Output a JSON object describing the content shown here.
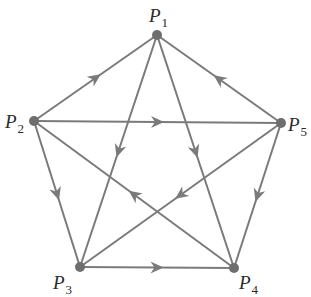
{
  "diagram": {
    "type": "directed-graph",
    "colors": {
      "edge": "#7a7a7a",
      "node": "#6e6e6e",
      "label": "#2a2a2a",
      "background": "#ffffff"
    },
    "nodes": [
      {
        "id": "P1",
        "letter": "P",
        "sub": "1",
        "x": 157,
        "y": 35,
        "label_x": 149,
        "label_y": 22
      },
      {
        "id": "P2",
        "letter": "P",
        "sub": "2",
        "x": 34,
        "y": 121,
        "label_x": 5,
        "label_y": 128
      },
      {
        "id": "P3",
        "letter": "P",
        "sub": "3",
        "x": 80,
        "y": 267,
        "label_x": 53,
        "label_y": 289
      },
      {
        "id": "P4",
        "letter": "P",
        "sub": "4",
        "x": 234,
        "y": 268,
        "label_x": 239,
        "label_y": 289
      },
      {
        "id": "P5",
        "letter": "P",
        "sub": "5",
        "x": 281,
        "y": 123,
        "label_x": 288,
        "label_y": 131
      }
    ],
    "edges": [
      {
        "from": "P2",
        "to": "P1"
      },
      {
        "from": "P5",
        "to": "P1"
      },
      {
        "from": "P1",
        "to": "P3"
      },
      {
        "from": "P1",
        "to": "P4"
      },
      {
        "from": "P2",
        "to": "P5"
      },
      {
        "from": "P2",
        "to": "P3"
      },
      {
        "from": "P4",
        "to": "P2"
      },
      {
        "from": "P5",
        "to": "P4"
      },
      {
        "from": "P5",
        "to": "P3"
      },
      {
        "from": "P3",
        "to": "P4"
      }
    ]
  }
}
